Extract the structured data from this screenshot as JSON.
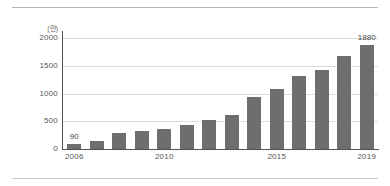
{
  "chart_data": {
    "type": "bar",
    "title": "",
    "xlabel": "",
    "ylabel": "",
    "y_unit_label": "(만)",
    "ylim": [
      0,
      2000
    ],
    "yticks": [
      0,
      500,
      1000,
      1500,
      2000
    ],
    "ytick_labels": [
      "0",
      "500",
      "1000",
      "1500",
      "2000"
    ],
    "grid": true,
    "legend": "none",
    "categories": [
      "2006",
      "2007",
      "2008",
      "2009",
      "2010",
      "2011",
      "2012",
      "2013",
      "2014",
      "2015",
      "2016",
      "2017",
      "2018",
      "2019"
    ],
    "xtick_labels_shown": [
      "2006",
      "2010",
      "2015",
      "2019"
    ],
    "xtick_label_indices": [
      0,
      4,
      9,
      13
    ],
    "values": [
      90,
      150,
      280,
      330,
      360,
      440,
      520,
      620,
      930,
      1090,
      1320,
      1430,
      1680,
      1880
    ],
    "data_labels": [
      {
        "index": 0,
        "text": "90"
      },
      {
        "index": 13,
        "text": "1880"
      }
    ],
    "bar_color": "#6e6e6e",
    "gridline_color": "#dcdcdc",
    "axis_color": "#555555",
    "background_color": "#ffffff"
  }
}
